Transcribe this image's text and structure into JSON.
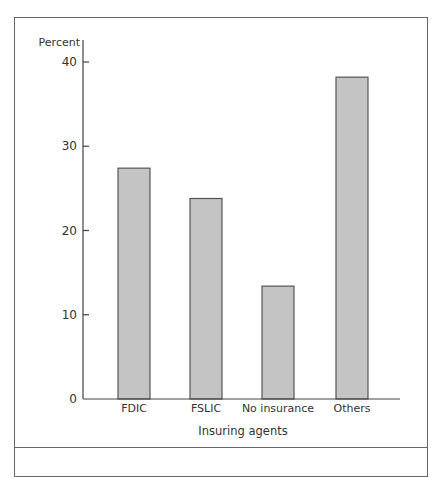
{
  "chart_data": {
    "type": "bar",
    "title": "",
    "categories": [
      "FDIC",
      "FSLIC",
      "No insurance",
      "Others"
    ],
    "values": [
      27.4,
      23.8,
      13.4,
      38.2
    ],
    "xlabel": "Insuring agents",
    "ylabel": "Percent",
    "ylim": [
      0,
      40
    ],
    "yticks": [
      0,
      10,
      20,
      30,
      40
    ],
    "grid": false,
    "legend": null
  },
  "colors": {
    "bar_fill": "#c4c4c4",
    "bar_stroke": "#555555",
    "axis": "#444444",
    "frame": "#666666"
  }
}
